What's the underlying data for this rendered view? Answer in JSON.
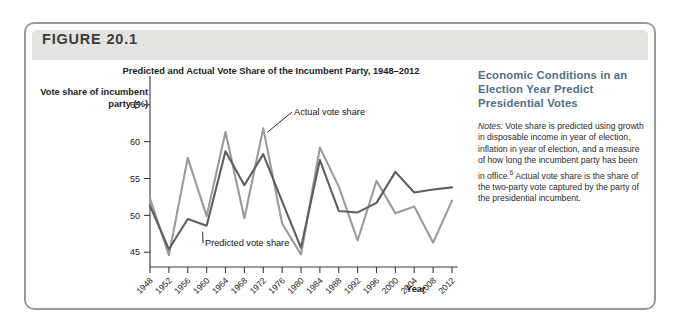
{
  "figure": {
    "number_label": "FIGURE 20.1"
  },
  "side": {
    "heading": "Economic Conditions in an Election Year Predict Presidential Votes",
    "notes_lead": "Notes:",
    "notes_body": " Vote share is predicted using growth in disposable income in year of election, inflation in year of election, and a measure of how long the incumbent party has been in office.",
    "notes_superscript": "6",
    "notes_body_2": " Actual vote share is the share of the two-party vote captured by the party of the presidential incumbent."
  },
  "annotations": {
    "actual": "Actual vote share",
    "predicted": "Predicted vote share"
  },
  "colors": {
    "actual_line": "#9a9a9a",
    "predicted_line": "#5e5e5e",
    "axis": "#3a3a3a",
    "header_band": "#e3e3e0",
    "frame": "#9a9a96",
    "side_heading": "#4d6e86"
  },
  "chart_data": {
    "type": "line",
    "title": "Predicted and Actual Vote Share of the Incumbent Party, 1948–2012",
    "xlabel": "Year",
    "ylabel": "Vote share of incumbent party (%)",
    "ylim": [
      43,
      67
    ],
    "yticks": [
      45,
      50,
      55,
      60,
      65
    ],
    "grid": false,
    "legend_position": "inline-annotations",
    "categories": [
      1948,
      1952,
      1956,
      1960,
      1964,
      1968,
      1972,
      1976,
      1980,
      1984,
      1988,
      1992,
      1996,
      2000,
      2004,
      2008,
      2012
    ],
    "xticklabels": [
      "1948",
      "1952",
      "1956",
      "1960",
      "1964",
      "1968",
      "1972",
      "1976",
      "1980",
      "1984",
      "1988",
      "1992",
      "1996",
      "2000",
      "2004",
      "2008",
      "2012"
    ],
    "series": [
      {
        "name": "Actual vote share",
        "color": "#9a9a9a",
        "values": [
          52.3,
          44.6,
          57.8,
          49.9,
          61.3,
          49.6,
          61.8,
          48.9,
          44.7,
          59.2,
          53.9,
          46.6,
          54.7,
          50.3,
          51.2,
          46.3,
          52.0
        ]
      },
      {
        "name": "Predicted vote share",
        "color": "#5e5e5e",
        "values": [
          51.3,
          45.4,
          49.5,
          48.6,
          58.7,
          54.1,
          58.3,
          51.9,
          45.6,
          57.5,
          50.6,
          50.4,
          51.7,
          55.9,
          53.1,
          53.5,
          53.8
        ]
      }
    ]
  }
}
